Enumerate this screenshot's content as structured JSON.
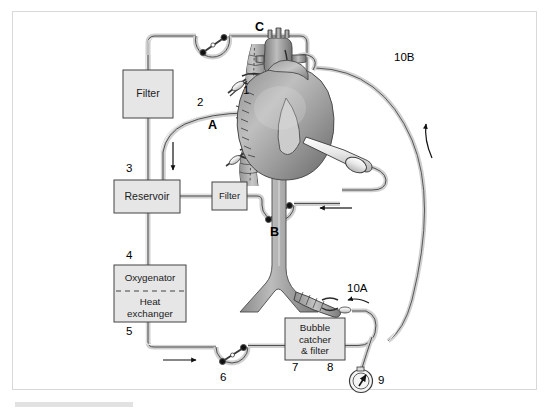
{
  "figure": {
    "background_color": "#ffffff",
    "frame_border_color": "#d9d9d9"
  },
  "components": {
    "filter_top": {
      "label": "Filter"
    },
    "reservoir": {
      "label": "Reservoir"
    },
    "filter_side": {
      "label": "Filter"
    },
    "oxygenator": {
      "label": "Oxygenator"
    },
    "heat_exchanger": {
      "label": "Heat\nexchanger"
    },
    "bubble_catcher": {
      "label": "Bubble\ncatcher\n& filter"
    }
  },
  "callouts": [
    {
      "id": "1",
      "text": "1"
    },
    {
      "id": "2",
      "text": "2"
    },
    {
      "id": "3",
      "text": "3"
    },
    {
      "id": "4",
      "text": "4"
    },
    {
      "id": "5",
      "text": "5"
    },
    {
      "id": "6",
      "text": "6"
    },
    {
      "id": "7",
      "text": "7"
    },
    {
      "id": "8",
      "text": "8"
    },
    {
      "id": "9",
      "text": "9"
    },
    {
      "id": "10A",
      "text": "10A"
    },
    {
      "id": "10B",
      "text": "10B"
    },
    {
      "id": "A",
      "text": "A"
    },
    {
      "id": "B",
      "text": "B"
    },
    {
      "id": "C",
      "text": "C"
    }
  ],
  "colors": {
    "tubing_outline": "#4a4a4a",
    "tubing_fill": "#d6d6d6",
    "box_fill": "#e6e6e6",
    "box_border": "#444444",
    "heart_dark": "#6e6e6e",
    "heart_mid": "#9a9a9a",
    "heart_light": "#c9c9c9",
    "vessel_fill": "#a8a8a8",
    "arrow": "#111111"
  }
}
